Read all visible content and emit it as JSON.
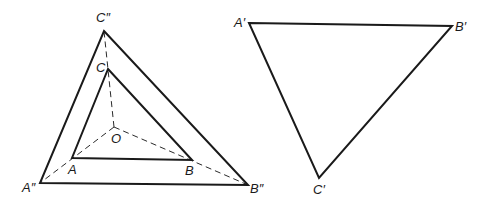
{
  "diagram": {
    "points": {
      "O": {
        "label": "O"
      },
      "A": {
        "label": "A"
      },
      "B": {
        "label": "B"
      },
      "C": {
        "label": "C"
      },
      "A2": {
        "label": "A″"
      },
      "B2": {
        "label": "B″"
      },
      "C2": {
        "label": "C″"
      },
      "A1": {
        "label": "A′"
      },
      "B1": {
        "label": "B′"
      },
      "C1": {
        "label": "C′"
      }
    },
    "triangles": [
      {
        "name": "ABC",
        "vertices": [
          "A",
          "B",
          "C"
        ],
        "style": "solid"
      },
      {
        "name": "A″B″C″",
        "vertices": [
          "A2",
          "B2",
          "C2"
        ],
        "style": "solid"
      },
      {
        "name": "A′B′C′",
        "vertices": [
          "A1",
          "B1",
          "C1"
        ],
        "style": "solid"
      }
    ],
    "rays": [
      {
        "from": "O",
        "to": "A2",
        "style": "dashed"
      },
      {
        "from": "O",
        "to": "B2",
        "style": "dashed"
      },
      {
        "from": "O",
        "to": "C2",
        "style": "dashed"
      }
    ]
  }
}
